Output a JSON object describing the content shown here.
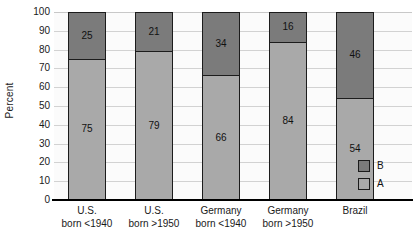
{
  "chart_data": {
    "type": "bar",
    "subtype": "stacked-bar-100",
    "title": "",
    "xlabel": "",
    "ylabel": "Percent",
    "ylim": [
      0,
      100
    ],
    "ytick_step": 10,
    "yticks": [
      "100",
      "90",
      "80",
      "70",
      "60",
      "50",
      "40",
      "30",
      "20",
      "10",
      "0"
    ],
    "grid": true,
    "grid_axis": "y",
    "legend_position": "inside-bottom-right",
    "categories": [
      "U.S. born <1940",
      "U.S. born >1950",
      "Germany born <1940",
      "Germany born >1950",
      "Brazil"
    ],
    "category_lines": [
      {
        "line1": "U.S.",
        "line2": "born <1940"
      },
      {
        "line1": "U.S.",
        "line2": "born >1950"
      },
      {
        "line1": "Germany",
        "line2": "born <1940"
      },
      {
        "line1": "Germany",
        "line2": "born >1950"
      },
      {
        "line1": "Brazil",
        "line2": ""
      }
    ],
    "series": [
      {
        "name": "A",
        "color": "#a9a9a9",
        "values": [
          75,
          79,
          66,
          84,
          54
        ]
      },
      {
        "name": "B",
        "color": "#7b7b7b",
        "values": [
          25,
          21,
          34,
          16,
          46
        ]
      }
    ],
    "stack_order_top_to_bottom": [
      "B",
      "A"
    ],
    "bars": [
      {
        "category": "U.S. born <1940",
        "B": 25,
        "A": 75
      },
      {
        "category": "U.S. born >1950",
        "B": 21,
        "A": 79
      },
      {
        "category": "Germany born <1940",
        "B": 34,
        "A": 66
      },
      {
        "category": "Germany born >1950",
        "B": 16,
        "A": 84
      },
      {
        "category": "Brazil",
        "B": 46,
        "A": 54
      }
    ]
  },
  "legend": {
    "entries": [
      {
        "label": "B",
        "color": "#7b7b7b"
      },
      {
        "label": "A",
        "color": "#a9a9a9"
      }
    ]
  },
  "colors": {
    "series_b": "#7b7b7b",
    "series_a": "#a9a9a9",
    "outline": "#1c1c1c",
    "gridline": "#d2d2d2",
    "axis": "#000000",
    "plot_background": "#fbfbfb",
    "text": "#1a1a1a"
  }
}
